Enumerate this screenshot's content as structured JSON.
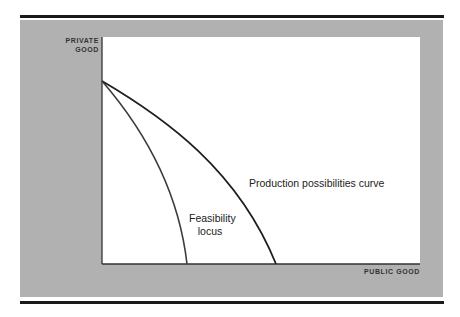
{
  "diagram": {
    "title": "",
    "axes": {
      "y_label_line1": "PRIVATE",
      "y_label_line2": "GOOD",
      "x_label": "PUBLIC GOOD"
    },
    "curves": [
      {
        "name": "Production possibilities curve",
        "label": "Production possibilities curve",
        "color": "#1e1e1e",
        "path": "M102,81 C165,118 238,170 276,264"
      },
      {
        "name": "Feasibility locus",
        "label_line1": "Feasibility",
        "label_line2": "locus",
        "color": "#3c3c3c",
        "path": "M102,81 C140,125 178,185 187,264"
      }
    ],
    "colors": {
      "panel": "#b1b1b1",
      "plot_background": "#ffffff",
      "rule": "#1a1a1a",
      "axis": "#333333"
    }
  }
}
